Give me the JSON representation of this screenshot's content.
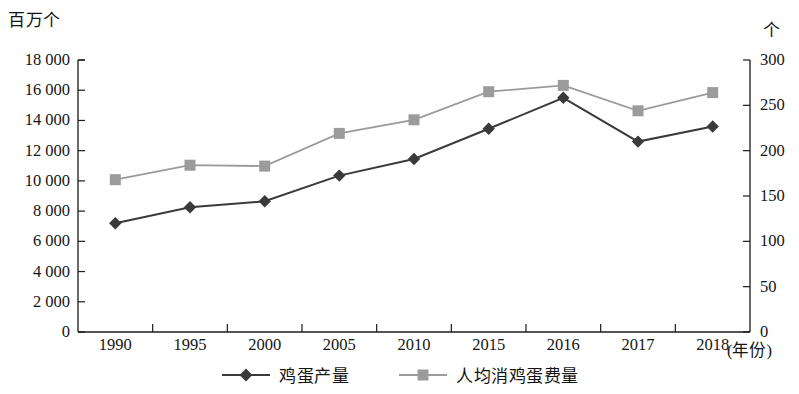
{
  "chart_data": {
    "type": "line",
    "title": "",
    "subtitle": "",
    "xlabel": "(年份)",
    "x_unit_label": "(年份)",
    "categories": [
      "1990",
      "1995",
      "2000",
      "2005",
      "2010",
      "2015",
      "2016",
      "2017",
      "2018"
    ],
    "grid": false,
    "legend_position": "bottom",
    "axes": {
      "left": {
        "unit_label": "百万个",
        "ylim": [
          0,
          18000
        ],
        "tick_step": 2000,
        "tick_labels": [
          "0",
          "2 000",
          "4 000",
          "6 000",
          "8 000",
          "10 000",
          "12 000",
          "14 000",
          "16 000",
          "18 000"
        ],
        "tick_values": [
          0,
          2000,
          4000,
          6000,
          8000,
          10000,
          12000,
          14000,
          16000,
          18000
        ]
      },
      "right": {
        "unit_label": "个",
        "ylim": [
          0,
          300
        ],
        "tick_step": 50,
        "tick_labels": [
          "0",
          "50",
          "100",
          "150",
          "200",
          "250",
          "300"
        ],
        "tick_values": [
          0,
          50,
          100,
          150,
          200,
          250,
          300
        ]
      }
    },
    "series": [
      {
        "name": "鸡蛋产量",
        "axis": "left",
        "marker": "diamond",
        "color": "#3a3a3a",
        "values": [
          7200,
          8250,
          8650,
          10350,
          11450,
          13450,
          15500,
          12600,
          13600
        ]
      },
      {
        "name": "人均消鸡蛋费量",
        "axis": "right",
        "marker": "square",
        "color": "#9b9b9b",
        "values": [
          168,
          184,
          183,
          219,
          234,
          265,
          272,
          244,
          264
        ]
      }
    ],
    "legend": [
      {
        "label": "鸡蛋产量",
        "marker": "diamond",
        "color": "#3a3a3a"
      },
      {
        "label": "人均消鸡蛋费量",
        "marker": "square",
        "color": "#9b9b9b"
      }
    ]
  },
  "colors": {
    "series_production": "#3a3a3a",
    "series_consumption": "#9b9b9b",
    "axis": "#1a1a1a",
    "text": "#141414",
    "background": "#ffffff"
  }
}
